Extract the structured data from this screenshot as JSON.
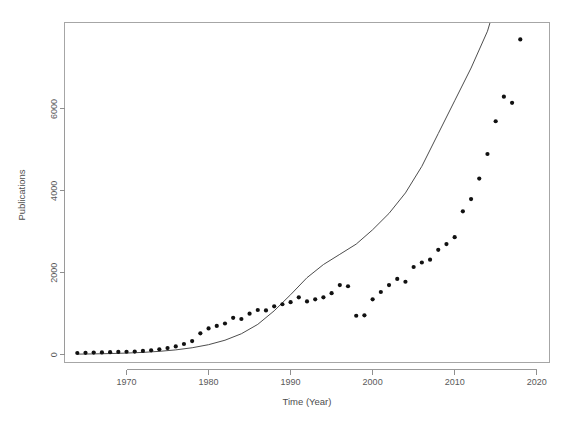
{
  "chart_data": {
    "type": "scatter",
    "title": "",
    "xlabel": "Time (Year)",
    "ylabel": "Publications",
    "xlim": [
      1962.5,
      2021.5
    ],
    "ylim": [
      -180,
      8100
    ],
    "xticks": [
      1970,
      1980,
      1990,
      2000,
      2010,
      2020
    ],
    "xtick_labels": [
      "1970",
      "1980",
      "1990",
      "2000",
      "2010",
      "2020"
    ],
    "yticks": [
      0,
      2000,
      4000,
      6000
    ],
    "ytick_labels": [
      "0",
      "2000",
      "4000",
      "6000"
    ],
    "grid": false,
    "legend": null,
    "series": [
      {
        "name": "Publications",
        "type": "scatter",
        "marker": "filled-circle",
        "color": "#111111",
        "x": [
          1964,
          1965,
          1966,
          1967,
          1968,
          1969,
          1970,
          1971,
          1972,
          1973,
          1974,
          1975,
          1976,
          1977,
          1978,
          1979,
          1980,
          1981,
          1982,
          1983,
          1984,
          1985,
          1986,
          1987,
          1988,
          1989,
          1990,
          1991,
          1992,
          1993,
          1994,
          1995,
          1996,
          1997,
          1998,
          1999,
          2000,
          2001,
          2002,
          2003,
          2004,
          2005,
          2006,
          2007,
          2008,
          2009,
          2010,
          2011,
          2012,
          2013,
          2014,
          2015,
          2016,
          2017,
          2018
        ],
        "y": [
          40,
          45,
          50,
          55,
          60,
          65,
          70,
          75,
          90,
          105,
          130,
          160,
          200,
          260,
          330,
          520,
          640,
          700,
          760,
          900,
          870,
          1000,
          1090,
          1080,
          1180,
          1230,
          1280,
          1400,
          1300,
          1350,
          1400,
          1500,
          1700,
          1670,
          950,
          960,
          1350,
          1530,
          1700,
          1850,
          1780,
          2140,
          2250,
          2320,
          2560,
          2700,
          2870,
          3500,
          3800,
          4300,
          4900,
          5700,
          6300,
          6150,
          7700
        ]
      },
      {
        "name": "Exponential fit",
        "type": "line",
        "color": "#4d4d4d",
        "model": "exponential",
        "x": [
          1964,
          1966,
          1968,
          1970,
          1972,
          1974,
          1976,
          1978,
          1980,
          1982,
          1984,
          1986,
          1988,
          1990,
          1992,
          1994,
          1996,
          1998,
          2000,
          2002,
          2004,
          2006,
          2008,
          2010,
          2012,
          2014,
          2014.3
        ],
        "y": [
          12,
          18,
          26,
          38,
          55,
          80,
          116,
          168,
          243,
          352,
          510,
          739,
          1070,
          1463,
          1880,
          2200,
          2450,
          2700,
          3050,
          3450,
          3950,
          4600,
          5400,
          6200,
          7000,
          7900,
          8100
        ]
      }
    ]
  },
  "axes": {
    "x_title": "Time (Year)",
    "y_title": "Publications"
  }
}
